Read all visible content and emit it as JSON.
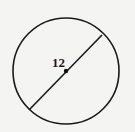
{
  "diagram": {
    "type": "circle-with-diameter",
    "circle": {
      "cx": 66,
      "cy": 71,
      "r": 53,
      "stroke": "#1a1a1a"
    },
    "diameter": {
      "x1": 29,
      "y1": 110,
      "x2": 102,
      "y2": 35
    },
    "center_point": {
      "cx": 66,
      "cy": 71,
      "r": 2.2
    },
    "label": {
      "text": "12",
      "x": 52,
      "y": 67
    }
  }
}
